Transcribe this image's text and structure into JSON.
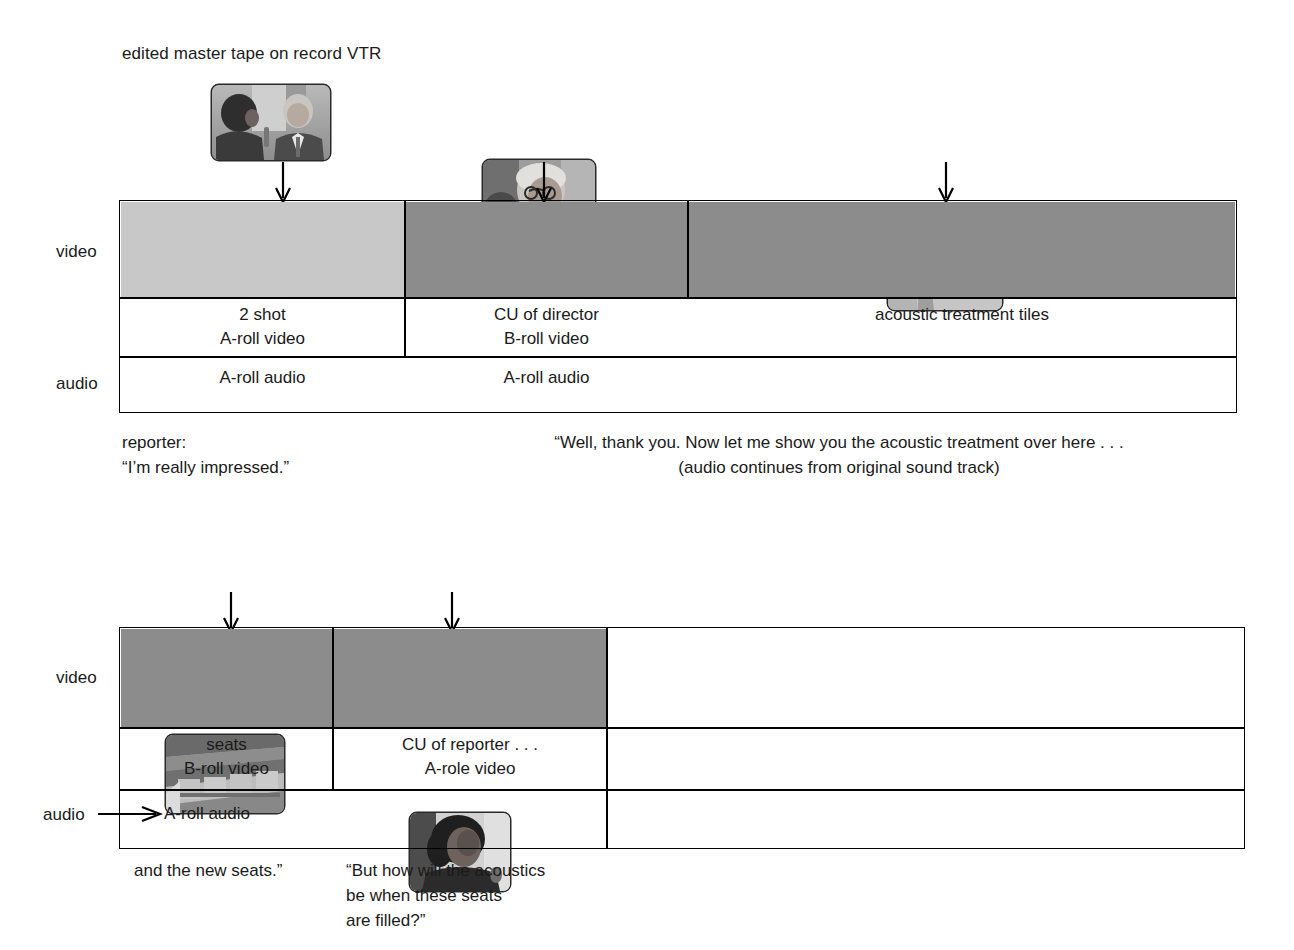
{
  "diagram": {
    "title": "edited master tape on record VTR",
    "track_labels": {
      "video": "video",
      "audio": "audio"
    }
  },
  "sequence_1": {
    "thumbnails": [
      {
        "name": "two-shot-reporter-and-director",
        "alt": "2 shot of reporter interviewing director"
      },
      {
        "name": "cu-of-director",
        "alt": "close up of director"
      },
      {
        "name": "acoustic-treatment-tiles",
        "alt": "acoustic treatment tiles on wall"
      }
    ],
    "video_cells": [
      {
        "line1": "2 shot",
        "line2": "A-roll video",
        "shade": "#c8c8c8"
      },
      {
        "line1": "CU of director",
        "line2": "B-roll video",
        "shade": "#8c8c8c"
      },
      {
        "line1": "acoustic treatment tiles",
        "line2": "",
        "shade": "#8c8c8c"
      }
    ],
    "audio_cells": [
      {
        "text": "A-roll audio"
      },
      {
        "text": "A-roll audio"
      }
    ],
    "captions": [
      {
        "line1": "reporter:",
        "line2": "“I’m really impressed.”"
      },
      {
        "line1": "“Well, thank you. Now let me show you the acoustic treatment over here . . .",
        "line2": "(audio continues from original sound track)"
      }
    ]
  },
  "sequence_2": {
    "thumbnails": [
      {
        "name": "auditorium-seats",
        "alt": "rows of auditorium seats"
      },
      {
        "name": "cu-of-reporter",
        "alt": "close up of reporter"
      }
    ],
    "video_cells": [
      {
        "line1": "seats",
        "line2": "B-roll video",
        "shade": "#8c8c8c"
      },
      {
        "line1": "CU of reporter . . .",
        "line2": "A-role video",
        "shade": "#8c8c8c"
      },
      {
        "line1": "",
        "line2": "",
        "shade": "#ffffff"
      }
    ],
    "audio_cells": [
      {
        "text": "A-roll audio"
      }
    ],
    "captions": [
      {
        "line1": "and the new seats.”",
        "line2": "",
        "line3": "",
        "line4": ""
      },
      {
        "line1": "“But how will the acoustics",
        "line2": "be when these seats",
        "line3": "are filled?”",
        "line4": ""
      }
    ]
  },
  "colors": {
    "ink": "#1a1a1a",
    "rule": "#000000",
    "shade_light": "#c8c8c8",
    "shade_dark": "#8c8c8c",
    "page": "#ffffff"
  }
}
